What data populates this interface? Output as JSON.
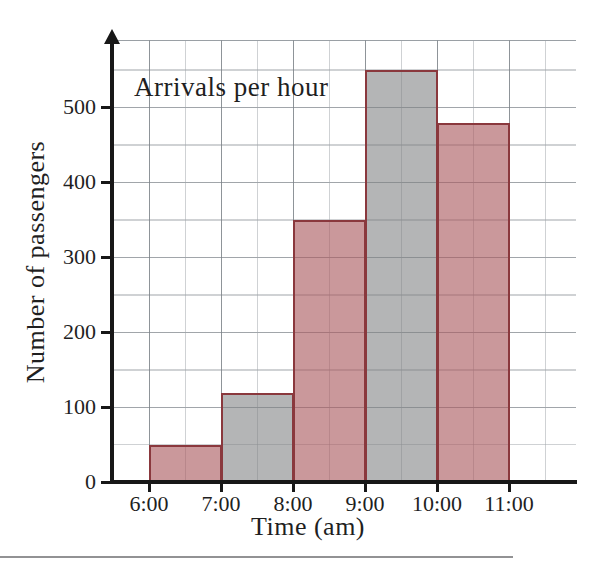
{
  "figure": {
    "title": "Arrivals per hour",
    "x_axis_label": "Time (am)",
    "y_axis_label": "Number of passengers"
  },
  "chart_data": {
    "type": "bar",
    "subtype": "histogram",
    "title": "Arrivals per hour",
    "xlabel": "Time (am)",
    "ylabel": "Number of passengers",
    "bins": [
      "6:00-7:00",
      "7:00-8:00",
      "8:00-9:00",
      "9:00-10:00",
      "10:00-11:00"
    ],
    "values": [
      50,
      120,
      350,
      550,
      480
    ],
    "x_tick_labels": [
      "6:00",
      "7:00",
      "8:00",
      "9:00",
      "10:00",
      "11:00"
    ],
    "y_tick_values": [
      0,
      100,
      200,
      300,
      400,
      500
    ],
    "ylim": [
      0,
      585
    ],
    "grid": true,
    "legend": "none",
    "bar_fill_colors": [
      "rgba(169,89,94,0.62)",
      "rgba(125,127,130,0.58)",
      "rgba(169,89,94,0.62)",
      "rgba(125,127,130,0.58)",
      "rgba(169,89,94,0.62)"
    ],
    "bar_fill_names": [
      "pink-hatched",
      "gray-hatched",
      "pink-hatched",
      "gray-hatched",
      "pink-hatched"
    ],
    "bar_border_color": "#8a383d"
  }
}
